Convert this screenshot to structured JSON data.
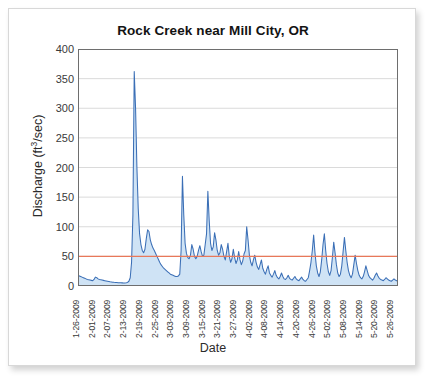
{
  "chart_data": {
    "type": "line",
    "title": "Rock Creek near Mill City, OR",
    "xlabel": "Date",
    "ylabel": "Discharge (ft3/sec)",
    "ylabel_parts": {
      "text": "Discharge (ft",
      "sup": "3",
      "tail": "/sec)"
    },
    "ylim": [
      0,
      400
    ],
    "yticks": [
      0,
      50,
      100,
      150,
      200,
      250,
      300,
      350,
      400
    ],
    "grid": "horizontal",
    "legend": "none",
    "colors": {
      "line": "#3b6fb6",
      "fill": "#cfe3f5",
      "reference_line": "#e8785a",
      "grid": "#d0d0d0",
      "axis": "#6e6e6e",
      "text": "#2b2b2b"
    },
    "reference_line": {
      "value": 50,
      "color": "#e8785a"
    },
    "xtick_labels": [
      "1-26-2009",
      "2-01-2009",
      "2-07-2009",
      "2-13-2009",
      "2-19-2009",
      "2-25-2009",
      "3-03-2009",
      "3-09-2009",
      "3-15-2009",
      "3-21-2009",
      "3-27-2009",
      "4-02-2009",
      "4-08-2009",
      "4-14-2009",
      "4-20-2009",
      "4-26-2009",
      "5-02-2009",
      "5-08-2009",
      "5-14-2009",
      "5-20-2009",
      "5-26-2009"
    ],
    "xtick_step_days": 6,
    "x_start": "1-26-2009",
    "x_end": "5-28-2009",
    "series": [
      {
        "name": "Discharge",
        "values": [
          18,
          17,
          16,
          15,
          14,
          13,
          12,
          11,
          10.5,
          10,
          9.5,
          9,
          11,
          15,
          14,
          12,
          11,
          10.5,
          10,
          9.5,
          9,
          8.5,
          8,
          7.5,
          7,
          6.8,
          6.5,
          6.2,
          6,
          5.8,
          5.6,
          5.5,
          5.4,
          5.3,
          5.2,
          5.2,
          5.5,
          6,
          8,
          14,
          40,
          120,
          362,
          300,
          200,
          130,
          88,
          70,
          60,
          56,
          62,
          80,
          95,
          92,
          78,
          70,
          64,
          60,
          55,
          50,
          45,
          40,
          36,
          33,
          30,
          28,
          26,
          24,
          22,
          20,
          19,
          18,
          17,
          16,
          16,
          17,
          20,
          60,
          185,
          120,
          72,
          55,
          48,
          46,
          52,
          70,
          62,
          50,
          46,
          50,
          60,
          68,
          58,
          50,
          52,
          70,
          88,
          160,
          110,
          72,
          60,
          66,
          90,
          78,
          60,
          52,
          56,
          70,
          62,
          50,
          44,
          58,
          72,
          50,
          40,
          46,
          62,
          48,
          38,
          44,
          58,
          44,
          36,
          42,
          54,
          60,
          100,
          78,
          52,
          40,
          34,
          44,
          52,
          40,
          32,
          28,
          36,
          44,
          30,
          24,
          20,
          28,
          34,
          22,
          18,
          15,
          20,
          26,
          18,
          14,
          12,
          16,
          22,
          16,
          12,
          11,
          14,
          18,
          13,
          11,
          10,
          13,
          16,
          12,
          10,
          9,
          12,
          15,
          11,
          9,
          8,
          11,
          14,
          26,
          40,
          60,
          86,
          56,
          34,
          22,
          16,
          24,
          44,
          70,
          88,
          60,
          38,
          24,
          18,
          26,
          48,
          74,
          56,
          36,
          22,
          16,
          20,
          34,
          58,
          82,
          60,
          40,
          26,
          18,
          14,
          20,
          36,
          52,
          38,
          26,
          18,
          14,
          12,
          16,
          24,
          34,
          26,
          18,
          14,
          12,
          10,
          13,
          18,
          22,
          17,
          13,
          11,
          10,
          9,
          11,
          14,
          12,
          10,
          9,
          8,
          10,
          12,
          10,
          9,
          8
        ]
      }
    ],
    "annotations": [
      {
        "text": "peak discharge",
        "value": 362,
        "near_date": "2-25-2009"
      },
      {
        "text": "secondary peak",
        "value": 185,
        "near_date": "3-15-2009"
      },
      {
        "text": "secondary peak",
        "value": 160,
        "near_date": "3-27-2009"
      }
    ]
  }
}
